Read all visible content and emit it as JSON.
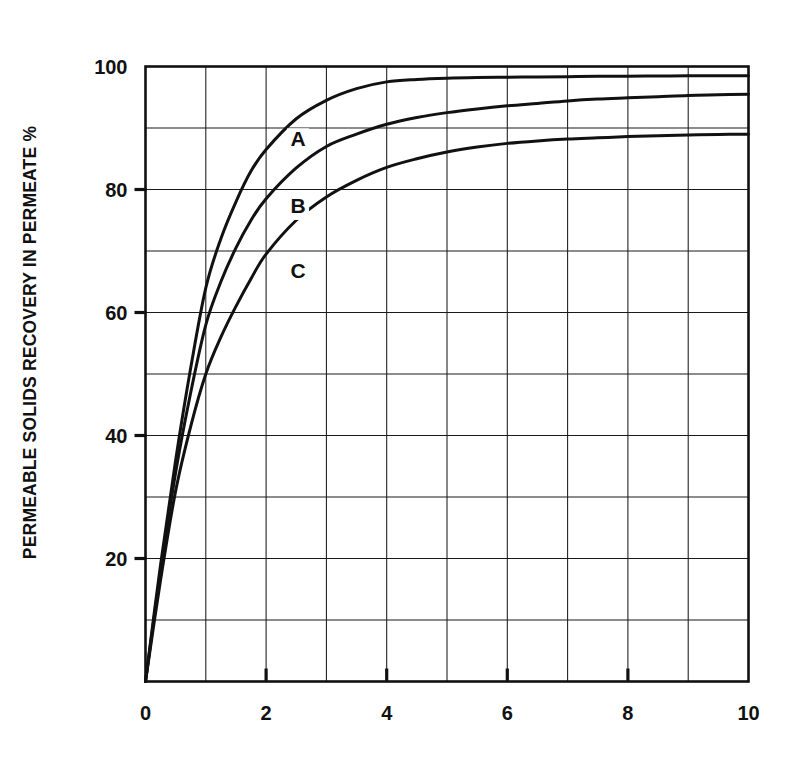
{
  "chart_data": {
    "type": "line",
    "title": "",
    "subtitle": "",
    "xlabel": "",
    "ylabel": "PERMEABLE SOLIDS RECOVERY IN PERMEATE   %",
    "ylabel_unit": "%",
    "xlim": [
      0,
      10
    ],
    "ylim": [
      0,
      100
    ],
    "grid": true,
    "grid_x_step": 1,
    "grid_y_step": 10,
    "legend_position": "inline-curve-labels",
    "xticklabels": [
      "0",
      "2",
      "4",
      "6",
      "8",
      "10"
    ],
    "xtickvalues": [
      0,
      2,
      4,
      6,
      8,
      10
    ],
    "yticklabels": [
      "20",
      "40",
      "60",
      "80",
      "100"
    ],
    "ytickvalues": [
      20,
      40,
      60,
      80,
      100
    ],
    "x": [
      0,
      0.25,
      0.5,
      0.75,
      1,
      1.25,
      1.5,
      1.75,
      2,
      2.5,
      3,
      3.5,
      4,
      4.5,
      5,
      5.5,
      6,
      6.5,
      7,
      7.5,
      8,
      8.5,
      9,
      9.5,
      10
    ],
    "series": [
      {
        "name": "A",
        "label": "A",
        "label_x": 2.53,
        "label_y": 88.0,
        "color": "#111111",
        "values": [
          0,
          19,
          36,
          51,
          64,
          72,
          78,
          83,
          86.5,
          91.5,
          94.5,
          96.4,
          97.5,
          97.9,
          98.1,
          98.2,
          98.25,
          98.3,
          98.35,
          98.4,
          98.42,
          98.45,
          98.48,
          98.5,
          98.5
        ]
      },
      {
        "name": "B",
        "label": "B",
        "label_x": 2.53,
        "label_y": 77.0,
        "color": "#111111",
        "values": [
          0,
          18,
          34,
          47,
          58,
          65,
          70.5,
          75,
          78.5,
          83.5,
          87,
          89,
          90.6,
          91.7,
          92.5,
          93.1,
          93.6,
          94.0,
          94.4,
          94.7,
          94.9,
          95.1,
          95.3,
          95.4,
          95.5
        ]
      },
      {
        "name": "C",
        "label": "C",
        "label_x": 2.53,
        "label_y": 66.5,
        "color": "#111111",
        "values": [
          0,
          16.5,
          31,
          41.5,
          50,
          56,
          61,
          65.5,
          69.5,
          75,
          78.8,
          81.5,
          83.6,
          85.0,
          86.1,
          86.9,
          87.5,
          87.9,
          88.2,
          88.4,
          88.6,
          88.75,
          88.85,
          88.95,
          89.0
        ]
      }
    ]
  },
  "axes": {
    "y_unit_symbol": "%"
  }
}
